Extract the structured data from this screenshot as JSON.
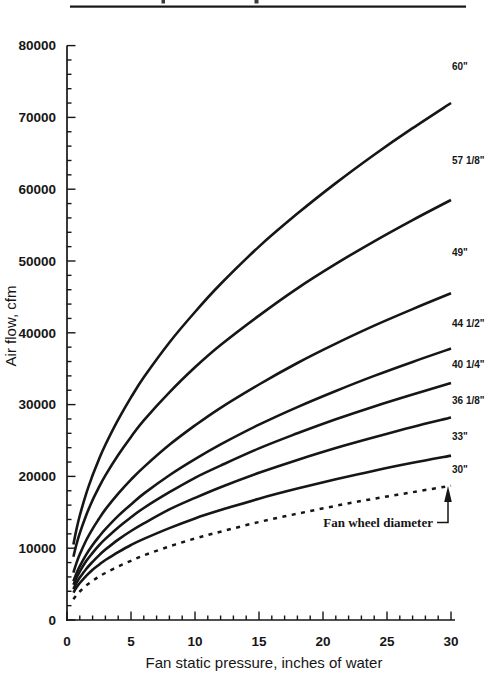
{
  "figure": {
    "ink_color": "#161616",
    "background_color": "#ffffff",
    "top_rule": true
  },
  "chart_data": {
    "type": "line",
    "title": "",
    "xlabel": "Fan static pressure, inches of water",
    "ylabel": "Air flow, cfm",
    "xlim": [
      0,
      30
    ],
    "ylim": [
      0,
      80000
    ],
    "x_major_ticks": [
      0,
      5,
      10,
      15,
      20,
      25,
      30
    ],
    "x_minor_tick_step": 1,
    "y_major_ticks": [
      0,
      10000,
      20000,
      30000,
      40000,
      50000,
      60000,
      70000,
      80000
    ],
    "y_minor_tick_step": 2000,
    "grid": false,
    "legend_position": "labels at right end of each curve",
    "annotation": {
      "label": "Fan wheel diameter",
      "arrow": "points up to the 30\" dashed curve"
    },
    "x": [
      0.5,
      0.75,
      1,
      1.5,
      2,
      2.5,
      3,
      4,
      5,
      6,
      8,
      10,
      12,
      15,
      18,
      21,
      24,
      27,
      30
    ],
    "series": [
      {
        "name": "60\"",
        "style": "solid",
        "values": [
          10500,
          12700,
          14550,
          17600,
          20150,
          22400,
          24400,
          27900,
          31000,
          33800,
          38650,
          42900,
          46800,
          52000,
          56600,
          60850,
          64800,
          68500,
          72000
        ]
      },
      {
        "name": "57 1/8\"",
        "style": "solid",
        "values": [
          8800,
          10600,
          12100,
          14600,
          16700,
          18500,
          20150,
          23000,
          25500,
          27800,
          31700,
          35200,
          38300,
          42400,
          46200,
          49600,
          52750,
          55700,
          58500
        ]
      },
      {
        "name": "49\"",
        "style": "solid",
        "values": [
          6600,
          8000,
          9150,
          11100,
          12700,
          14100,
          15400,
          17600,
          19550,
          21300,
          24400,
          27100,
          29550,
          32800,
          35800,
          38500,
          41000,
          43300,
          45500
        ]
      },
      {
        "name": "44 1/2\"",
        "style": "solid",
        "values": [
          5400,
          6550,
          7500,
          9100,
          10450,
          11600,
          12650,
          14500,
          16100,
          17600,
          20150,
          22400,
          24450,
          27200,
          29650,
          31900,
          34000,
          35950,
          37800
        ]
      },
      {
        "name": "40 1/4\"",
        "style": "solid",
        "values": [
          4900,
          5900,
          6750,
          8200,
          9350,
          10400,
          11300,
          12900,
          14300,
          15600,
          17800,
          19800,
          21500,
          23900,
          26000,
          27950,
          29750,
          31400,
          33000
        ]
      },
      {
        "name": "36 1/8\"",
        "style": "solid",
        "values": [
          4300,
          5200,
          5900,
          7100,
          8100,
          9000,
          9800,
          11200,
          12400,
          13450,
          15400,
          17000,
          18500,
          20500,
          22300,
          23950,
          25450,
          26900,
          28200
        ]
      },
      {
        "name": "33\"",
        "style": "solid",
        "values": [
          3800,
          4550,
          5150,
          6150,
          7000,
          7700,
          8350,
          9450,
          10450,
          11300,
          12800,
          14150,
          15300,
          16900,
          18300,
          19600,
          20800,
          21900,
          22900
        ]
      },
      {
        "name": "30\"",
        "style": "dashed",
        "values": [
          2900,
          3500,
          3975,
          4800,
          5450,
          6050,
          6550,
          7450,
          8250,
          9000,
          10250,
          11350,
          12300,
          13650,
          14800,
          15900,
          16900,
          17800,
          18700
        ]
      }
    ]
  }
}
